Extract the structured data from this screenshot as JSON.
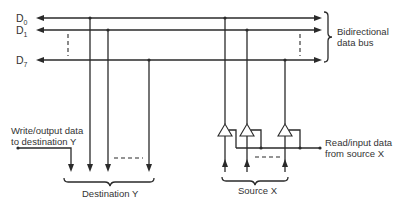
{
  "diagram": {
    "bus_lines": [
      {
        "name": "D",
        "subscript": "0"
      },
      {
        "name": "D",
        "subscript": "1"
      },
      {
        "name": "D",
        "subscript": "7"
      }
    ],
    "bus_label": [
      "Bidirectional",
      "data bus"
    ],
    "write_label": [
      "Write/output data",
      "to destination Y"
    ],
    "read_label": [
      "Read/input data",
      "from source X"
    ],
    "destination_label": "Destination Y",
    "source_label": "Source X"
  }
}
